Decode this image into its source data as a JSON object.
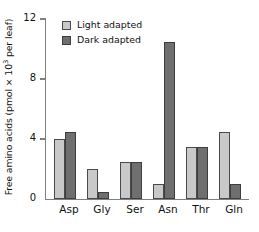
{
  "chart_data": {
    "type": "bar",
    "title": "",
    "xlabel": "",
    "ylabel": "Free amino acids (pmol × 10³ per leaf)",
    "ylabel_prefix": "Free amino acids (pmol × 10",
    "ylabel_exponent": "3",
    "ylabel_suffix": " per leaf)",
    "categories": [
      "Asp",
      "Gly",
      "Ser",
      "Asn",
      "Thr",
      "Gln"
    ],
    "series": [
      {
        "name": "Light adapted",
        "color": "#c9c9c9",
        "values": [
          4.0,
          2.0,
          2.5,
          1.0,
          3.5,
          4.5
        ]
      },
      {
        "name": "Dark adapted",
        "color": "#6f6f6f",
        "values": [
          4.5,
          0.5,
          2.5,
          10.5,
          3.5,
          1.0
        ]
      }
    ],
    "ylim": [
      0,
      12
    ],
    "yticks": [
      0,
      4,
      8,
      12
    ],
    "ytick_labels": [
      "0",
      "4",
      "8",
      "12"
    ],
    "grid": false,
    "legend_position": "top-left"
  },
  "legend": {
    "items": [
      {
        "label": "Light adapted",
        "swatch": "light"
      },
      {
        "label": "Dark adapted",
        "swatch": "dark"
      }
    ]
  },
  "axis": {
    "y_tick_0": "0",
    "y_tick_4": "4",
    "y_tick_8": "8",
    "y_tick_12": "12"
  },
  "categories": {
    "c0": "Asp",
    "c1": "Gly",
    "c2": "Ser",
    "c3": "Asn",
    "c4": "Thr",
    "c5": "Gln"
  }
}
